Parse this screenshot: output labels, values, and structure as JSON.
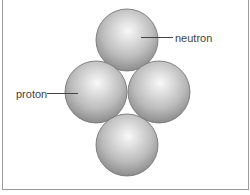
{
  "diagram": {
    "title": "",
    "particles": [
      {
        "id": "top",
        "cx": 127,
        "cy": 40,
        "r": 31
      },
      {
        "id": "left",
        "cx": 96,
        "cy": 92,
        "r": 31
      },
      {
        "id": "right",
        "cx": 159,
        "cy": 92,
        "r": 31
      },
      {
        "id": "bottom",
        "cx": 127,
        "cy": 145,
        "r": 31
      }
    ],
    "labels": {
      "neutron": "neutron",
      "proton": "proton"
    },
    "colors": {
      "sphere_highlight": "#f6f6f6",
      "sphere_mid": "#c4c4c4",
      "sphere_edge": "#8a8a8a",
      "outline": "#6f6f6f",
      "leader_line": "#444444",
      "frame": "#9a9a9a"
    }
  }
}
